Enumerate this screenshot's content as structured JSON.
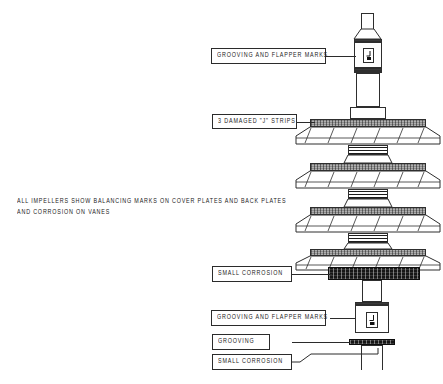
{
  "document": {
    "type": "engineering-inspection-drawing",
    "subject": "Multi-stage pump rotor / impeller shaft assembly",
    "background_color": "#ffffff",
    "line_color": "#2b2b2b"
  },
  "general_note": {
    "line1": "ALL IMPELLERS SHOW BALANCING MARKS ON COVER PLATES AND BACK PLATES",
    "line2": "AND CORROSION ON VANES"
  },
  "callouts": [
    {
      "id": "grooving-flapper-top",
      "label": "GROOVING AND FLAPPER MARKS"
    },
    {
      "id": "damaged-j-strips",
      "label": "3 DAMAGED \"J\" STRIPS"
    },
    {
      "id": "small-corrosion-mid",
      "label": "SMALL CORROSION"
    },
    {
      "id": "grooving-flapper-bottom",
      "label": "GROOVING AND FLAPPER MARKS"
    },
    {
      "id": "grooving",
      "label": "GROOVING"
    },
    {
      "id": "small-corrosion-bottom",
      "label": "SMALL CORROSION"
    }
  ],
  "assembly": {
    "impeller_stage_count": 4,
    "vanes_per_stage": 6,
    "spacer_count": 3,
    "surface_finish_symbol": "⌐"
  }
}
